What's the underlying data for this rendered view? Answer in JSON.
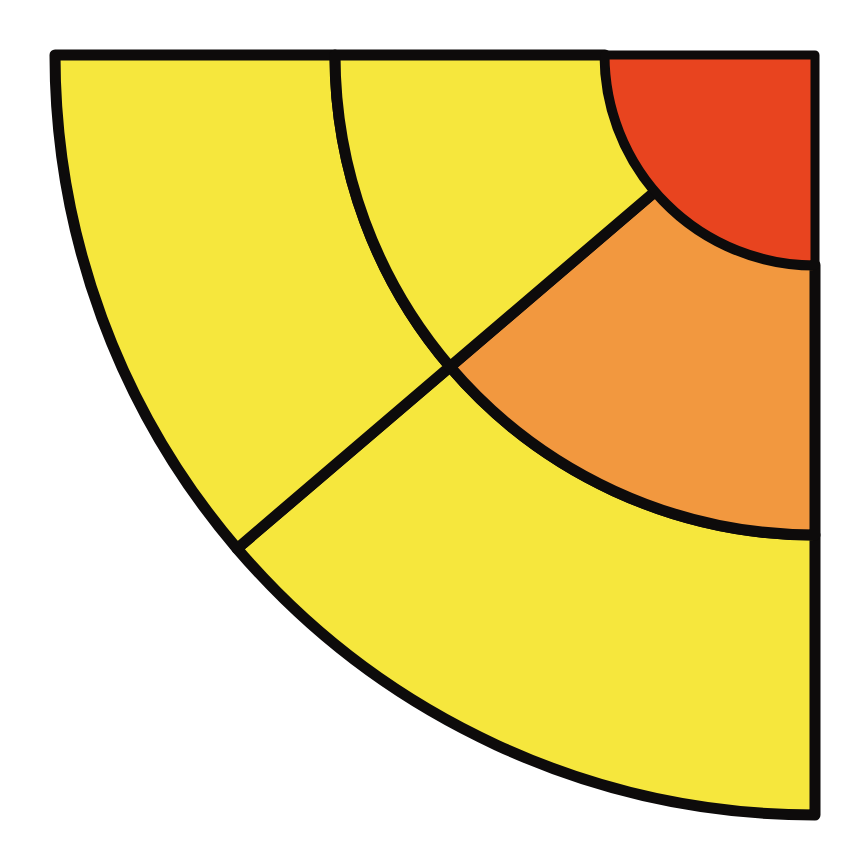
{
  "figure": {
    "background_color": "#ffffff",
    "width": 861,
    "height": 855,
    "stroke_color": "#0d0b0b",
    "stroke_width": 11
  },
  "chart_data": {
    "type": "pie",
    "variant": "sunburst-quarter",
    "title": "",
    "subtitle": "",
    "xlabel": "",
    "ylabel": "",
    "grid": false,
    "legend": "none",
    "annotations": [],
    "tick_labels": [],
    "center": {
      "x": 815,
      "y": 55
    },
    "orientation": "quadrant-opening-down-left",
    "start_angle_deg": 90,
    "end_angle_deg": 180,
    "total_sweep_deg": 90,
    "radii": [
      0,
      210,
      480,
      760
    ],
    "ring_names": [
      "inner",
      "middle",
      "outer"
    ],
    "colors": {
      "red": "#e8441f",
      "orange": "#f2983f",
      "yellow": "#f6e73d",
      "outline": "#0d0b0b"
    },
    "rings": [
      {
        "level": 0,
        "name": "inner",
        "inner_radius": 0,
        "outer_radius": 210,
        "segments": [
          {
            "label": "root",
            "color": "#e8441f",
            "start_angle_deg": 90,
            "end_angle_deg": 180,
            "sweep_deg": 90,
            "value": 100
          }
        ]
      },
      {
        "level": 1,
        "name": "middle",
        "inner_radius": 210,
        "outer_radius": 480,
        "segments": [
          {
            "label": "branch-a",
            "color": "#f2983f",
            "start_angle_deg": 90,
            "end_angle_deg": 139.5,
            "sweep_deg": 49.5,
            "value": 55
          },
          {
            "label": "branch-b",
            "color": "#f2983f",
            "start_angle_deg": 139.5,
            "end_angle_deg": 180,
            "sweep_deg": 40.5,
            "value": 45
          }
        ]
      },
      {
        "level": 2,
        "name": "outer",
        "inner_radius": 480,
        "outer_radius": 760,
        "segments": [
          {
            "label": "leaf-a",
            "color": "#f6e73d",
            "start_angle_deg": 90,
            "end_angle_deg": 139.5,
            "sweep_deg": 49.5,
            "value": 55
          },
          {
            "label": "leaf-b",
            "color": "#f6e73d",
            "start_angle_deg": 139.5,
            "end_angle_deg": 180,
            "sweep_deg": 40.5,
            "value": 45
          }
        ]
      }
    ],
    "extra_segments": [
      {
        "label": "branch-b-middle-yellow",
        "color": "#f6e73d",
        "inner_radius": 210,
        "outer_radius": 480,
        "start_angle_deg": 139.5,
        "end_angle_deg": 180,
        "note": "middle ring left wedge rendered yellow"
      }
    ]
  }
}
